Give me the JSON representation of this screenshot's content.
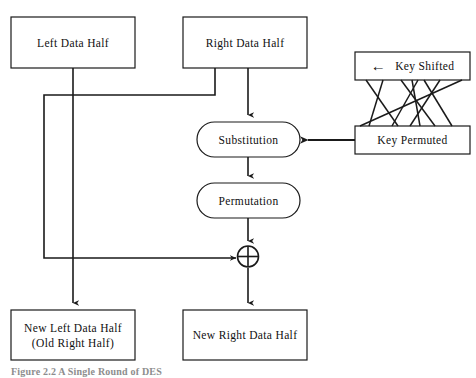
{
  "diagram": {
    "nodes": {
      "left_data_half": {
        "label": "Left Data Half",
        "shape": "rectangle"
      },
      "right_data_half": {
        "label": "Right Data Half",
        "shape": "rectangle"
      },
      "key_shifted": {
        "label": "Key Shifted",
        "shape": "rectangle",
        "has_left_arrow": "←"
      },
      "key_permuted": {
        "label": "Key Permuted",
        "shape": "rectangle"
      },
      "substitution": {
        "label": "Substitution",
        "shape": "rounded-rectangle"
      },
      "permutation": {
        "label": "Permutation",
        "shape": "rounded-rectangle"
      },
      "xor": {
        "label": "",
        "shape": "circle-plus",
        "symbol": "xor-operator"
      },
      "new_left_data_half": {
        "label_line1": "New Left Data Half",
        "label_line2": "(Old Right Half)",
        "shape": "rectangle"
      },
      "new_right_data_half": {
        "label": "New Right Data Half",
        "shape": "rectangle"
      }
    },
    "edges": [
      {
        "from": "left_data_half",
        "to": "new_left_data_half",
        "arrow": true
      },
      {
        "from": "right_data_half",
        "to": "xor",
        "arrow": true
      },
      {
        "from": "right_data_half",
        "to": "substitution",
        "arrow": true
      },
      {
        "from": "substitution",
        "to": "permutation",
        "arrow": true
      },
      {
        "from": "permutation",
        "to": "xor",
        "arrow": true
      },
      {
        "from": "xor",
        "to": "new_right_data_half",
        "arrow": true
      },
      {
        "from": "key_permuted",
        "to": "substitution",
        "arrow": true
      },
      {
        "from": "key_shifted",
        "to": "key_permuted",
        "arrow": false,
        "style": "crossing-permutation-lines"
      }
    ],
    "caption": "Figure 2.2  A Single Round of DES",
    "colors": {
      "stroke": "#1a1a1a",
      "text": "#101010",
      "background": "#ffffff",
      "caption": "#8d8d8d"
    }
  }
}
